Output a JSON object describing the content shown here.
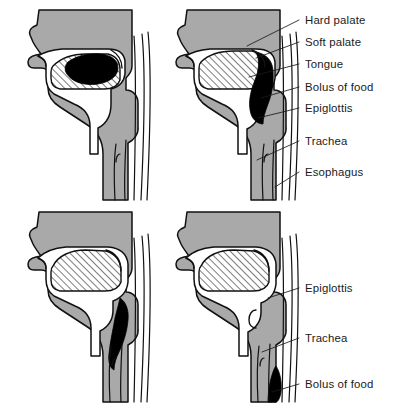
{
  "figure": {
    "panels": [
      {
        "id": "panel-1",
        "stage": "1",
        "position": "top-left",
        "description": "Bolus of food held in mouth on tongue"
      },
      {
        "id": "panel-2",
        "stage": "2",
        "position": "top-right",
        "description": "Bolus pushed back into pharynx, soft palate raised"
      },
      {
        "id": "panel-3",
        "stage": "3",
        "position": "bottom-left",
        "description": "Epiglottis closes trachea, bolus enters esophagus"
      },
      {
        "id": "panel-4",
        "stage": "4",
        "position": "bottom-right",
        "description": "Bolus travels down esophagus, airway reopens"
      }
    ]
  },
  "labels": {
    "upper": [
      {
        "key": "hard-palate",
        "text": "Hard palate",
        "y": 24,
        "lx1": 299,
        "ly1": 20,
        "lx2": 247,
        "ly2": 46
      },
      {
        "key": "soft-palate",
        "text": "Soft palate",
        "y": 46,
        "lx1": 299,
        "ly1": 42,
        "lx2": 256,
        "ly2": 58
      },
      {
        "key": "tongue",
        "text": "Tongue",
        "y": 68,
        "lx1": 299,
        "ly1": 64,
        "lx2": 249,
        "ly2": 77
      },
      {
        "key": "bolus-of-food",
        "text": "Bolus of food",
        "y": 91,
        "lx1": 299,
        "ly1": 87,
        "lx2": 261,
        "ly2": 98
      },
      {
        "key": "epiglottis",
        "text": "Epiglottis",
        "y": 112,
        "lx1": 299,
        "ly1": 108,
        "lx2": 258,
        "ly2": 118
      },
      {
        "key": "trachea",
        "text": "Trachea",
        "y": 145,
        "lx1": 299,
        "ly1": 141,
        "lx2": 257,
        "ly2": 160
      },
      {
        "key": "esophagus",
        "text": "Esophagus",
        "y": 176,
        "lx1": 299,
        "ly1": 172,
        "lx2": 275,
        "ly2": 187
      }
    ],
    "lower": [
      {
        "key": "epiglottis-2",
        "text": "Epiglottis",
        "y": 292,
        "lx1": 299,
        "ly1": 288,
        "lx2": 268,
        "ly2": 298
      },
      {
        "key": "trachea-2",
        "text": "Trachea",
        "y": 342,
        "lx1": 299,
        "ly1": 338,
        "lx2": 262,
        "ly2": 352
      },
      {
        "key": "bolus-of-food-2",
        "text": "Bolus of food",
        "y": 388,
        "lx1": 299,
        "ly1": 384,
        "lx2": 272,
        "ly2": 392
      }
    ],
    "text_x": 305
  },
  "colors": {
    "tissue_gray": "#a9a9a9",
    "outline": "#111111",
    "bolus_black": "#000000",
    "airway_white": "#ffffff",
    "label_text": "#1a1a1a",
    "background": "#ffffff"
  }
}
